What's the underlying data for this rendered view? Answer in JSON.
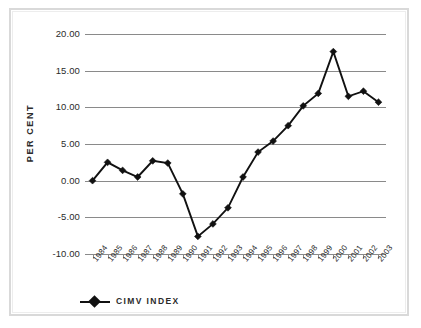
{
  "chart_data": {
    "type": "line",
    "title": "",
    "subtitle": "",
    "xlabel": "",
    "ylabel": "PER CENT",
    "categories": [
      "1984",
      "1985",
      "1986",
      "1987",
      "1988",
      "1989",
      "1990",
      "1991",
      "1992",
      "1993",
      "1994",
      "1995",
      "1996",
      "1997",
      "1998",
      "1999",
      "2000",
      "2001",
      "2002",
      "2003"
    ],
    "series": [
      {
        "name": "CIMV INDEX",
        "marker": "diamond",
        "color": "#111111",
        "values": [
          0.0,
          2.5,
          1.4,
          0.5,
          2.7,
          2.4,
          -1.8,
          -7.6,
          -5.9,
          -3.7,
          0.5,
          3.9,
          5.4,
          7.5,
          10.2,
          11.9,
          17.6,
          11.5,
          12.2,
          10.7
        ]
      }
    ],
    "ylim": [
      -10.0,
      20.0
    ],
    "yticks": [
      20.0,
      15.0,
      10.0,
      5.0,
      0.0,
      -5.0,
      -10.0
    ],
    "ytick_labels": [
      "20.00",
      "15.00",
      "10.00",
      "5.00",
      "0.00",
      "-5.00",
      "-10.00"
    ],
    "grid": true,
    "grid_axis": "y",
    "legend_position": "bottom-left",
    "legend_entries": [
      "CIMV INDEX"
    ]
  },
  "axis": {
    "y_title": "PER CENT"
  },
  "colors": {
    "series": "#111111",
    "grid": "#8a8a8a",
    "frame": "#d9d9d9",
    "text": "#2b2b2b"
  }
}
